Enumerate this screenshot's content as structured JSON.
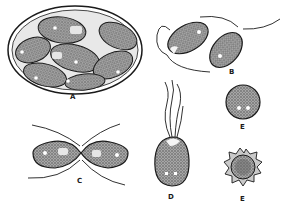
{
  "figure": {
    "labels": {
      "a": "A",
      "b": "B",
      "c": "C",
      "d": "D",
      "e1": "E",
      "e2": "E"
    },
    "colors": {
      "ink": "#1a1a1a",
      "stipple": "#8a8a8a",
      "background": "#ffffff",
      "vacuole": "#f4f4f4"
    }
  }
}
